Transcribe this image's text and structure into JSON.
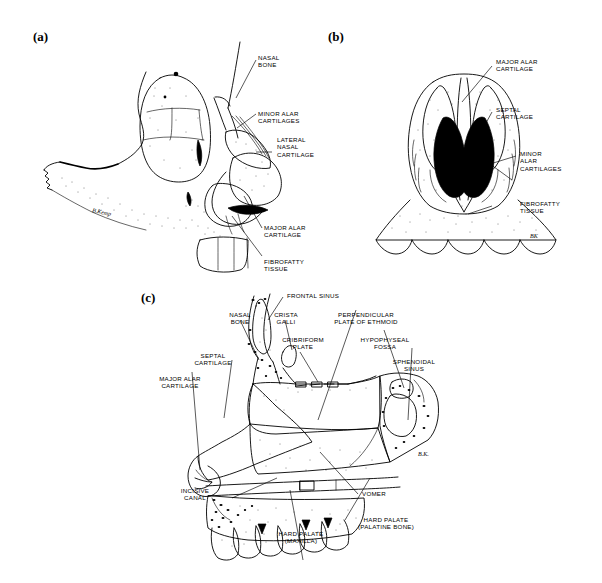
{
  "figure": {
    "type": "anatomical-illustration",
    "background_color": "#ffffff",
    "ink_color": "#000000",
    "cartilage_shade_color": "#808080",
    "panels": [
      {
        "id": "a",
        "letter": "(a)",
        "view": "Lateral (oblique) view of the skull and external nose showing nasal cartilages",
        "artist_signature": "B. Kemp",
        "labels": [
          {
            "id": "nasal-bone",
            "lines": [
              "NASAL",
              "BONE"
            ],
            "align": "left"
          },
          {
            "id": "minor-alar",
            "lines": [
              "MINOR ALAR",
              "CARTILAGES"
            ],
            "align": "left"
          },
          {
            "id": "lateral-nasal",
            "lines": [
              "LATERAL",
              "NASAL",
              "CARTILAGE"
            ],
            "align": "left"
          },
          {
            "id": "major-alar",
            "lines": [
              "MAJOR ALAR",
              "CARTILAGE"
            ],
            "align": "left"
          },
          {
            "id": "fibrofatty-tissue",
            "lines": [
              "FIBROFATTY",
              "TISSUE"
            ],
            "align": "left"
          }
        ]
      },
      {
        "id": "b",
        "letter": "(b)",
        "view": "Inferior view of the nose showing the nares and alar cartilages",
        "artist_signature": "BK",
        "labels": [
          {
            "id": "major-alar",
            "lines": [
              "MAJOR ALAR",
              "CARTILAGE"
            ],
            "align": "left"
          },
          {
            "id": "septal-cartilage",
            "lines": [
              "SEPTAL",
              "CARTILAGE"
            ],
            "align": "left"
          },
          {
            "id": "minor-alar",
            "lines": [
              "MINOR",
              "ALAR",
              "CARTILAGES"
            ],
            "align": "left"
          },
          {
            "id": "fibrofatty-tissue",
            "lines": [
              "FIBROFATTY",
              "TISSUE"
            ],
            "align": "left"
          }
        ]
      },
      {
        "id": "c",
        "letter": "(c)",
        "view": "Median sagittal section of the nasal septum and adjacent bones",
        "artist_signature": "B. K.",
        "labels": [
          {
            "id": "frontal-sinus",
            "lines": [
              "FRONTAL SINUS"
            ],
            "align": "left"
          },
          {
            "id": "nasal-bone",
            "lines": [
              "NASAL",
              "BONE"
            ],
            "align": "center"
          },
          {
            "id": "crista-galli",
            "lines": [
              "CRISTA",
              "GALLI"
            ],
            "align": "center"
          },
          {
            "id": "cribriform-plate",
            "lines": [
              "CRIBRIFORM",
              "PLATE"
            ],
            "align": "center"
          },
          {
            "id": "perpendicular-plate",
            "lines": [
              "PERPENDICULAR",
              "PLATE OF ETHMOID"
            ],
            "align": "center"
          },
          {
            "id": "hypophyseal-fossa",
            "lines": [
              "HYPOPHYSEAL",
              "FOSSA"
            ],
            "align": "center"
          },
          {
            "id": "sphenoidal-sinus",
            "lines": [
              "SPHENOIDAL",
              "SINUS"
            ],
            "align": "center"
          },
          {
            "id": "septal-cartilage",
            "lines": [
              "SEPTAL",
              "CARTILAGE"
            ],
            "align": "center"
          },
          {
            "id": "major-alar",
            "lines": [
              "MAJOR ALAR",
              "CARTILAGE"
            ],
            "align": "center"
          },
          {
            "id": "incisive-canal",
            "lines": [
              "INCISIVE",
              "CANAL"
            ],
            "align": "center"
          },
          {
            "id": "vomer",
            "lines": [
              "VOMER"
            ],
            "align": "left"
          },
          {
            "id": "hard-palate-maxilla",
            "lines": [
              "HARD PALATE",
              "(MAXILLA)"
            ],
            "align": "center"
          },
          {
            "id": "hard-palate-palatine",
            "lines": [
              "HARD PALATE",
              "(PALATINE BONE)"
            ],
            "align": "center"
          }
        ]
      }
    ]
  }
}
